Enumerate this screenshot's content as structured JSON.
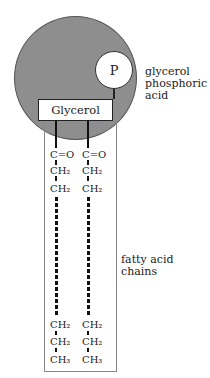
{
  "diagram": {
    "head": {
      "phosphate_label": "P",
      "glycerol_label": "Glycerol",
      "fill_color": "#8e8e8e"
    },
    "chains": {
      "top_groups": [
        "C=O",
        "CH₂",
        "CH₂"
      ],
      "bottom_groups": [
        "CH₂",
        "CH₂",
        "CH₃"
      ]
    },
    "labels": {
      "head_label_lines": [
        "glycerol",
        "phosphoric",
        "acid"
      ],
      "tail_label": "fatty acid chains"
    }
  }
}
